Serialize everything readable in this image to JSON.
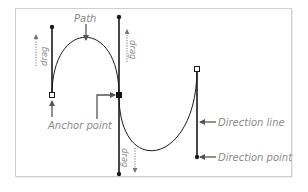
{
  "diagram": {
    "labels": {
      "path": "Path",
      "anchor_point": "Anchor point",
      "direction_line": "Direction line",
      "direction_point": "Direction point",
      "drag_left": "drag",
      "drag_middle_top": "drag",
      "drag_middle_bottom": "drag"
    },
    "colors": {
      "stroke": "#1a1a1a",
      "label": "#8a8a8a",
      "arrow": "#555555",
      "frame": "#cfcfcf"
    },
    "anchors": [
      {
        "name": "left-anchor",
        "x": 52,
        "y": 95,
        "style": "hollow"
      },
      {
        "name": "middle-anchor",
        "x": 119,
        "y": 95,
        "style": "filled"
      },
      {
        "name": "right-anchor",
        "x": 197,
        "y": 69,
        "style": "hollow"
      }
    ],
    "direction_points": [
      {
        "name": "left-top",
        "x": 52,
        "y": 27
      },
      {
        "name": "middle-top",
        "x": 119,
        "y": 17
      },
      {
        "name": "middle-bottom",
        "x": 119,
        "y": 174
      },
      {
        "name": "right-bottom",
        "x": 197,
        "y": 157
      }
    ]
  }
}
